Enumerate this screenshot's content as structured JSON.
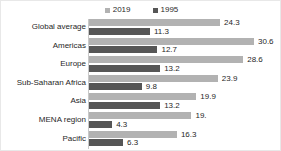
{
  "chart_data": {
    "type": "bar",
    "orientation": "horizontal",
    "title": "",
    "xlabel": "",
    "ylabel": "",
    "grid": false,
    "legend_position": "top-center",
    "xlim": [
      0,
      32
    ],
    "categories": [
      "Global average",
      "Americas",
      "Europe",
      "Sub-Saharan Africa",
      "Asia",
      "MENA region",
      "Pacific"
    ],
    "series": [
      {
        "name": "2019",
        "color": "#b2b2b2",
        "values": [
          24.3,
          30.6,
          28.6,
          23.9,
          19.9,
          19.0,
          16.3
        ],
        "labels": [
          "24.3",
          "30.6",
          "28.6",
          "23.9",
          "19.9",
          "19.",
          "16.3"
        ]
      },
      {
        "name": "1995",
        "color": "#565656",
        "values": [
          11.3,
          12.7,
          13.2,
          9.8,
          13.2,
          4.3,
          6.3
        ],
        "labels": [
          "11.3",
          "12.7",
          "13.2",
          "9.8",
          "13.2",
          "4.3",
          "6.3"
        ]
      }
    ]
  },
  "legend": {
    "entries": [
      {
        "label": "2019",
        "color": "#b2b2b2"
      },
      {
        "label": "1995",
        "color": "#565656"
      }
    ]
  }
}
